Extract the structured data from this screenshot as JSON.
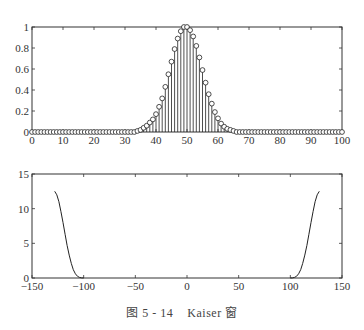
{
  "chart_data": [
    {
      "type": "stem",
      "title": "",
      "xlabel": "",
      "ylabel": "",
      "xlim": [
        0,
        100
      ],
      "ylim": [
        0,
        1
      ],
      "xticks": [
        0,
        10,
        20,
        30,
        40,
        50,
        60,
        70,
        80,
        90,
        100
      ],
      "yticks": [
        0,
        0.2,
        0.4,
        0.6,
        0.8,
        1
      ],
      "ytick_labels": [
        "0",
        "0.2",
        "0.4",
        "0.6",
        "0.8",
        "1"
      ],
      "grid": false,
      "x": [
        34,
        35,
        36,
        37,
        38,
        39,
        40,
        41,
        42,
        43,
        44,
        45,
        46,
        47,
        48,
        49,
        50,
        51,
        52,
        53,
        54,
        55,
        56,
        57,
        58,
        59,
        60,
        61,
        62,
        63,
        64,
        65
      ],
      "values": [
        0.01,
        0.02,
        0.04,
        0.06,
        0.09,
        0.12,
        0.17,
        0.24,
        0.32,
        0.43,
        0.55,
        0.67,
        0.79,
        0.89,
        0.96,
        1.0,
        1.0,
        0.97,
        0.91,
        0.82,
        0.71,
        0.59,
        0.47,
        0.36,
        0.27,
        0.19,
        0.13,
        0.08,
        0.05,
        0.03,
        0.02,
        0.01
      ],
      "note": "All other integer samples from 0 to 100 are 0"
    },
    {
      "type": "line",
      "title": "",
      "xlabel": "",
      "ylabel": "",
      "xlim": [
        -150,
        150
      ],
      "ylim": [
        0,
        15
      ],
      "xticks": [
        -150,
        -100,
        -50,
        0,
        50,
        100,
        150
      ],
      "yticks": [
        0,
        5,
        10,
        15
      ],
      "grid": false,
      "series": [
        {
          "name": "left",
          "x": [
            -128,
            -126,
            -124,
            -122,
            -120,
            -118,
            -116,
            -114,
            -112,
            -110,
            -108,
            -106,
            -104,
            -102,
            -100
          ],
          "values": [
            12.5,
            12.0,
            11.0,
            9.6,
            8.0,
            6.3,
            4.7,
            3.3,
            2.1,
            1.2,
            0.6,
            0.25,
            0.08,
            0.02,
            0
          ]
        },
        {
          "name": "right",
          "x": [
            100,
            102,
            104,
            106,
            108,
            110,
            112,
            114,
            116,
            118,
            120,
            122,
            124,
            126,
            128
          ],
          "values": [
            0,
            0.02,
            0.08,
            0.25,
            0.6,
            1.2,
            2.1,
            3.3,
            4.7,
            6.3,
            8.0,
            9.6,
            11.0,
            12.0,
            12.5
          ]
        }
      ]
    }
  ],
  "caption": {
    "figure_label": "图 5 - 14",
    "title": "Kaiser 窗"
  },
  "top_plot": {
    "x_labels": [
      "0",
      "10",
      "20",
      "30",
      "40",
      "50",
      "60",
      "70",
      "80",
      "90",
      "100"
    ],
    "y_labels": [
      "0",
      "0.2",
      "0.4",
      "0.6",
      "0.8",
      "1"
    ]
  },
  "bottom_plot": {
    "x_labels": [
      "-150",
      "-100",
      "-50",
      "0",
      "50",
      "100",
      "150"
    ],
    "y_labels": [
      "0",
      "5",
      "10",
      "15"
    ]
  }
}
